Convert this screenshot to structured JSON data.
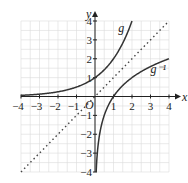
{
  "chart_data": {
    "type": "line",
    "title": "",
    "xlabel": "x",
    "ylabel": "y",
    "origin_label": "O",
    "xlim": [
      -4,
      4
    ],
    "ylim": [
      -4,
      4
    ],
    "grid": true,
    "x_ticks": [
      "-4",
      "-3",
      "-2",
      "-1",
      "1",
      "2",
      "3",
      "4"
    ],
    "y_ticks": [
      "4",
      "3",
      "2",
      "1",
      "-1",
      "-2",
      "-3",
      "-4"
    ],
    "series": [
      {
        "name": "g",
        "label": "g",
        "style": "solid",
        "formula": "y = 2^x",
        "x": [
          -4,
          -3,
          -2,
          -1,
          0,
          1,
          2
        ],
        "y": [
          0.0625,
          0.125,
          0.25,
          0.5,
          1,
          2,
          4
        ]
      },
      {
        "name": "g^-1",
        "label": "g⁻¹",
        "style": "solid",
        "formula": "y = log2(x)",
        "x": [
          0.0625,
          0.125,
          0.25,
          0.5,
          1,
          2,
          4
        ],
        "y": [
          -4,
          -3,
          -2,
          -1,
          0,
          1,
          2
        ]
      },
      {
        "name": "y=x",
        "label": "",
        "style": "dotted",
        "formula": "y = x",
        "x": [
          -4,
          4
        ],
        "y": [
          -4,
          4
        ]
      }
    ]
  }
}
